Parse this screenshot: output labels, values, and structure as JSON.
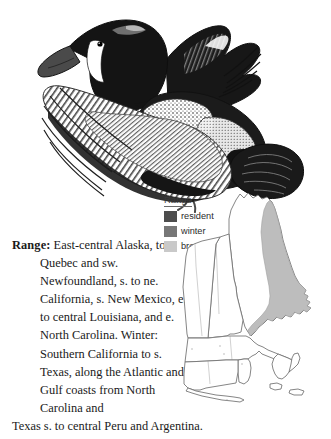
{
  "page": {
    "background_color": "#ffffff",
    "text_color": "#1a1a1a"
  },
  "illustration": {
    "name": "blue-winged-teal-in-flight",
    "description": "Pen-and-ink engraving of a duck in flight, dark head with white facial crescent, speckled breast, spread wings and tail"
  },
  "range_section": {
    "label": "Range:",
    "text": "East-central Alaska, to s. Quebec and sw. Newfoundland, s. to ne. California, s. New Mexico, e. to central Louisiana, and e. North Carolina. Winter: Southern California to s. Texas, along the Atlantic and Gulf coasts from North Carolina and",
    "last_line": "Texas s. to central Peru and Argentina.",
    "full_text": "Range: East-central Alaska, to s. Quebec and sw. Newfoundland, s. to ne. California, s. New Mexico, e. to central Louisiana, and e. North Carolina. Winter: Southern California to s. Texas, along the Atlantic and Gulf coasts from North Carolina and Texas s. to central Peru and Argentina."
  },
  "legend": {
    "title": "Range",
    "items": [
      {
        "label": "resident",
        "color": "#4d4d4d"
      },
      {
        "label": "winter",
        "color": "#777777"
      },
      {
        "label": "breeding",
        "color": "#c9c9c9"
      }
    ]
  },
  "map": {
    "name": "new-england-range-map",
    "region": "New England",
    "outline_color": "#6f6f6f",
    "shaded_color": "#b9b9b9",
    "shaded_region_legend_key": "winter"
  }
}
